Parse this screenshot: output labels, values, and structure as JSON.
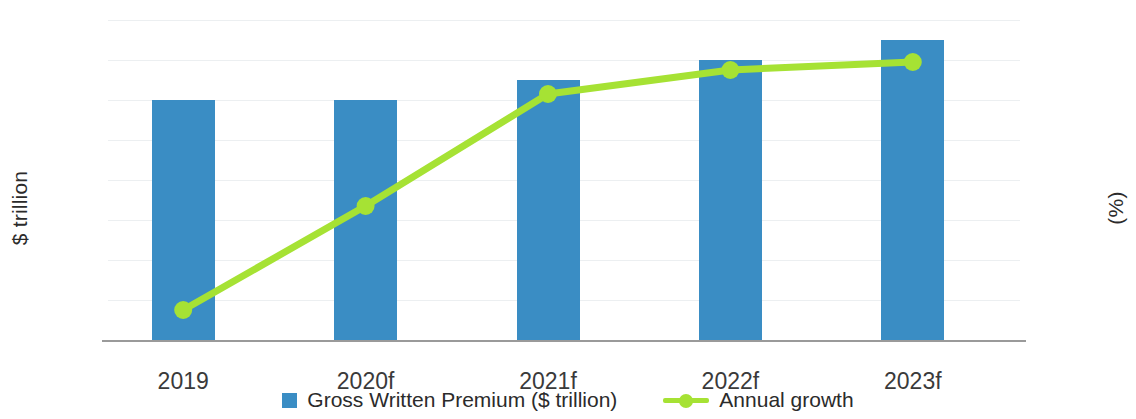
{
  "chart_data": {
    "type": "bar",
    "title": "",
    "categories": [
      "2019",
      "2020f",
      "2021f",
      "2022f",
      "2023f"
    ],
    "series": [
      {
        "name": "Gross Written Premium ($ trillion)",
        "type": "bar",
        "axis": "left",
        "color": "#3a8dc4",
        "values": [
          1.2,
          1.2,
          1.3,
          1.4,
          1.5
        ]
      },
      {
        "name": "Annual growth",
        "type": "line",
        "axis": "right",
        "color": "#a6e234",
        "values": [
          -0.25,
          2.35,
          5.15,
          5.75,
          5.95
        ]
      }
    ],
    "xlabel": "",
    "ylabel": "$ trillion",
    "y2label": "(%)",
    "ylim": [
      0,
      1.6
    ],
    "y2lim": [
      -1,
      7
    ],
    "yticks": [
      "0",
      "0.2",
      "0.4",
      "0.6",
      "0.8",
      "1",
      "1.2",
      "1.4",
      "1.6"
    ],
    "ytick_values": [
      0,
      0.2,
      0.4,
      0.6,
      0.8,
      1,
      1.2,
      1.4,
      1.6
    ],
    "y2ticks": [
      "-1",
      "0",
      "1",
      "2",
      "3",
      "4",
      "5",
      "6",
      "7"
    ],
    "y2tick_values": [
      -1,
      0,
      1,
      2,
      3,
      4,
      5,
      6,
      7
    ],
    "grid": true,
    "legend_position": "bottom",
    "legend": [
      "Gross Written Premium ($ trillion)",
      "Annual growth"
    ]
  },
  "axes": {
    "left_title": "$ trillion",
    "right_title": "(%)"
  },
  "legend": {
    "bar_label": "Gross Written Premium ($ trillion)",
    "line_label": "Annual growth"
  }
}
